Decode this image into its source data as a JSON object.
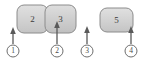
{
  "figure": {
    "type": "technical-diagram",
    "width": 146,
    "height": 64,
    "background_color": "#ffffff"
  },
  "style": {
    "block_fill": "#d2d2d2",
    "block_fill_light": "#dcdcdc",
    "block_stroke": "#8c8c8c",
    "callout_stroke": "#6e6e6e",
    "callout_fill": "#ffffff",
    "arrow_color": "#5a5a5a",
    "text_color": "#3b3b3b"
  },
  "blocks": [
    {
      "id": "block-2",
      "label": "2",
      "x": 17,
      "y": 5,
      "width": 31,
      "height": 28,
      "radius": 7
    },
    {
      "id": "block-3",
      "label": "3",
      "x": 45,
      "y": 5,
      "width": 31,
      "height": 28,
      "radius": 7
    },
    {
      "id": "block-5",
      "label": "5",
      "x": 100,
      "y": 8,
      "width": 33,
      "height": 24,
      "radius": 7
    }
  ],
  "callouts": [
    {
      "id": "callout-1",
      "label": "1",
      "circle_cx": 13,
      "circle_cy": 51,
      "circle_r": 6,
      "arrow_x": 13,
      "arrow_tip_y": 28,
      "arrow_base_y": 44
    },
    {
      "id": "callout-2",
      "label": "2",
      "circle_cx": 57,
      "circle_cy": 51,
      "circle_r": 6,
      "arrow_x": 57,
      "arrow_tip_y": 22,
      "arrow_base_y": 44
    },
    {
      "id": "callout-3",
      "label": "3",
      "circle_cx": 87,
      "circle_cy": 51,
      "circle_r": 6,
      "arrow_x": 87,
      "arrow_tip_y": 26,
      "arrow_base_y": 44
    },
    {
      "id": "callout-4",
      "label": "4",
      "circle_cx": 131,
      "circle_cy": 51,
      "circle_r": 6,
      "arrow_x": 131,
      "arrow_tip_y": 26,
      "arrow_base_y": 44
    }
  ]
}
